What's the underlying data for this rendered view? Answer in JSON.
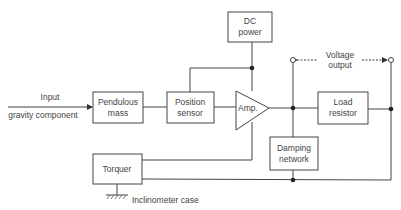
{
  "diagram": {
    "input": {
      "label": "Input",
      "sublabel": "gravity component"
    },
    "blocks": {
      "pendulous_mass": {
        "line1": "Pendulous",
        "line2": "mass"
      },
      "position_sensor": {
        "line1": "Position",
        "line2": "sensor"
      },
      "amplifier": {
        "label": "Amp."
      },
      "dc_power": {
        "line1": "DC",
        "line2": "power"
      },
      "load_resistor": {
        "line1": "Load",
        "line2": "resistor"
      },
      "damping_network": {
        "line1": "Damping",
        "line2": "network"
      },
      "torquer": {
        "label": "Torquer"
      }
    },
    "output": {
      "line1": "Voltage",
      "line2": "output"
    },
    "ground": {
      "label": "Inclinometer case"
    }
  }
}
